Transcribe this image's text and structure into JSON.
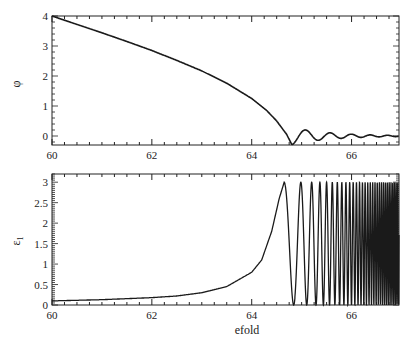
{
  "chart_data": [
    {
      "type": "line",
      "title": "",
      "xlabel": "",
      "ylabel": "φ",
      "xlim": [
        60,
        66.95
      ],
      "ylim": [
        -0.3,
        4.0
      ],
      "xticks": [
        60,
        62,
        64,
        66
      ],
      "xtick_labels": [
        "60",
        "62",
        "64",
        "66"
      ],
      "yticks": [
        0,
        1,
        2,
        3,
        4
      ],
      "ytick_labels": [
        "0",
        "1",
        "2",
        "3",
        "4"
      ],
      "grid": false,
      "legend": null,
      "series": [
        {
          "name": "phi",
          "description": "Decreases smoothly from 4.0 at efold 60 to a minimum near -0.3 at efold ~64.8, then damped oscillations about 0",
          "x": [
            60,
            60.5,
            61,
            61.5,
            62,
            62.5,
            63,
            63.5,
            64,
            64.3,
            64.5,
            64.7,
            64.8,
            64.95,
            65.1,
            65.25,
            65.45,
            65.6,
            65.8,
            66.0,
            66.3,
            66.95
          ],
          "y": [
            4.0,
            3.72,
            3.44,
            3.15,
            2.85,
            2.52,
            2.17,
            1.76,
            1.25,
            0.85,
            0.5,
            0.05,
            -0.28,
            -0.1,
            0.27,
            0.05,
            0.15,
            -0.05,
            0.08,
            -0.03,
            0.03,
            0.0
          ]
        }
      ]
    },
    {
      "type": "line",
      "title": "",
      "xlabel": "efold",
      "ylabel": "ε1",
      "xlim": [
        60,
        66.95
      ],
      "ylim": [
        0,
        3.2
      ],
      "xticks": [
        60,
        62,
        64,
        66
      ],
      "xtick_labels": [
        "60",
        "62",
        "64",
        "66"
      ],
      "yticks": [
        0,
        0.5,
        1,
        1.5,
        2,
        2.5,
        3
      ],
      "ytick_labels": [
        "0",
        "0.5",
        "1",
        "1.5",
        "2",
        "2.5",
        "3"
      ],
      "grid": false,
      "legend": null,
      "series": [
        {
          "name": "epsilon1",
          "description": "Slowly rising from ~0.1 to ~1 by efold 64.3, peaks at 3 near 64.65, then rapid oscillations between 0 and 3 with increasing frequency after efold 65",
          "x": [
            60,
            61,
            62,
            62.5,
            63,
            63.5,
            64,
            64.2,
            64.4,
            64.55,
            64.65
          ],
          "y": [
            0.1,
            0.13,
            0.18,
            0.22,
            0.3,
            0.45,
            0.8,
            1.1,
            1.8,
            2.6,
            3.0
          ],
          "oscillation": {
            "start": 64.65,
            "end": 66.95,
            "min": 0,
            "max": 3,
            "first_period": 0.45,
            "chirp": true
          }
        }
      ]
    }
  ]
}
